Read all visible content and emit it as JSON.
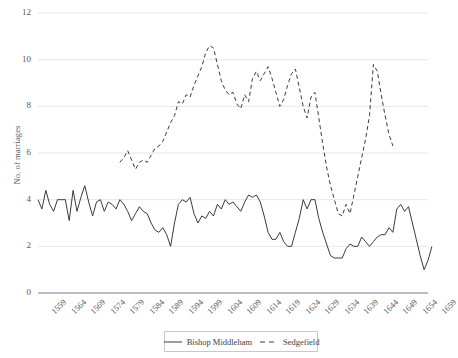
{
  "chart_data": {
    "type": "line",
    "title": "",
    "xlabel": "",
    "ylabel": "No. of marriages",
    "ylim": [
      0,
      12
    ],
    "ytick_values": [
      0,
      2,
      4,
      6,
      8,
      10,
      12
    ],
    "ytick_labels": [
      "0",
      "2",
      "4",
      "6",
      "8",
      "10",
      "12"
    ],
    "xlim": [
      1559,
      1659
    ],
    "xtick_values": [
      1559,
      1564,
      1569,
      1574,
      1579,
      1584,
      1589,
      1594,
      1599,
      1604,
      1609,
      1614,
      1619,
      1624,
      1629,
      1634,
      1639,
      1644,
      1649,
      1654,
      1659
    ],
    "xtick_labels": [
      "1559",
      "1564",
      "1569",
      "1574",
      "1579",
      "1584",
      "1589",
      "1594",
      "1599",
      "1604",
      "1609",
      "1614",
      "1619",
      "1624",
      "1629",
      "1634",
      "1639",
      "1644",
      "1649",
      "1654",
      "1659"
    ],
    "grid": "horizontal",
    "legend_position": "bottom",
    "series": [
      {
        "name": "Bishop Middleham",
        "style": "solid",
        "color": "#3b3b3b",
        "x_start": 1559,
        "values": [
          4.0,
          3.6,
          4.4,
          3.8,
          3.5,
          4.0,
          4.0,
          4.0,
          3.1,
          4.4,
          3.5,
          4.1,
          4.6,
          3.9,
          3.3,
          3.9,
          4.0,
          3.5,
          3.9,
          3.8,
          3.6,
          4.0,
          3.8,
          3.5,
          3.1,
          3.4,
          3.7,
          3.5,
          3.4,
          3.0,
          2.7,
          2.6,
          2.8,
          2.5,
          2.0,
          3.0,
          3.8,
          4.0,
          3.9,
          4.1,
          3.4,
          3.0,
          3.3,
          3.2,
          3.5,
          3.3,
          3.8,
          3.6,
          4.0,
          3.8,
          3.9,
          3.7,
          3.5,
          3.9,
          4.2,
          4.1,
          4.2,
          3.9,
          3.3,
          2.6,
          2.3,
          2.3,
          2.6,
          2.2,
          2.0,
          2.0,
          2.6,
          3.2,
          4.0,
          3.6,
          4.0,
          4.0,
          3.2,
          2.6,
          2.1,
          1.6,
          1.5,
          1.5,
          1.5,
          1.9,
          2.1,
          2.0,
          2.0,
          2.4,
          2.2,
          2.0,
          2.2,
          2.4,
          2.5,
          2.5,
          2.8,
          2.6,
          3.6,
          3.8,
          3.5,
          3.7,
          3.0,
          2.3,
          1.6,
          1.0,
          1.4,
          2.0
        ]
      },
      {
        "name": "Sedgefield",
        "style": "dashed",
        "color": "#3b3b3b",
        "x_start": 1580,
        "values": [
          5.6,
          5.8,
          6.1,
          5.7,
          5.3,
          5.6,
          5.7,
          5.6,
          5.9,
          6.2,
          6.3,
          6.5,
          6.9,
          7.3,
          7.6,
          8.2,
          8.1,
          8.5,
          8.4,
          8.9,
          9.3,
          9.7,
          10.3,
          10.6,
          10.5,
          9.8,
          9.1,
          8.7,
          8.5,
          8.6,
          8.1,
          7.9,
          8.5,
          8.2,
          9.2,
          9.5,
          9.1,
          9.4,
          9.7,
          9.2,
          8.6,
          8.0,
          8.3,
          8.9,
          9.4,
          9.6,
          8.8,
          8.0,
          7.5,
          8.4,
          8.6,
          7.5,
          6.4,
          5.4,
          4.6,
          4.0,
          3.4,
          3.3,
          3.8,
          3.4,
          4.2,
          5.0,
          5.8,
          6.6,
          7.6,
          9.8,
          9.5,
          8.5,
          7.6,
          6.8,
          6.3
        ]
      }
    ]
  },
  "legend": {
    "entries": [
      {
        "label": "Bishop Middleham",
        "style": "solid"
      },
      {
        "label": "Sedgefield",
        "style": "dashed"
      }
    ]
  }
}
